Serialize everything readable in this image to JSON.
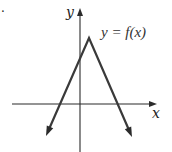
{
  "chart_data": {
    "type": "line",
    "title": "",
    "xlabel": "x",
    "ylabel": "y",
    "curve_label": "y = f(x)",
    "grid": false,
    "ticks_labeled": false,
    "xlim": [
      -6.8,
      7.7
    ],
    "ylim": [
      -4.8,
      9.6
    ],
    "axes_arrows": [
      "x-positive",
      "y-positive"
    ],
    "series": [
      {
        "name": "y = f(x)",
        "shape": "inverted-V (piecewise linear)",
        "points": [
          {
            "x": -3.4,
            "y": -3.2
          },
          {
            "x": 0.9,
            "y": 6.6
          },
          {
            "x": 5.2,
            "y": -3.3
          }
        ],
        "end_arrows": true,
        "vertex": {
          "x": 0.9,
          "y": 6.6
        },
        "y_intercept": 4.5,
        "x_intercepts": [
          -2.0,
          3.8
        ]
      }
    ],
    "annotations": [
      {
        "text": "y = f(x)",
        "near": "vertex",
        "position": "upper-right"
      }
    ],
    "units_note": "No numeric tick marks shown; values are in arbitrary units estimated from figure proportions."
  },
  "figure": {
    "stray_mark": "."
  }
}
